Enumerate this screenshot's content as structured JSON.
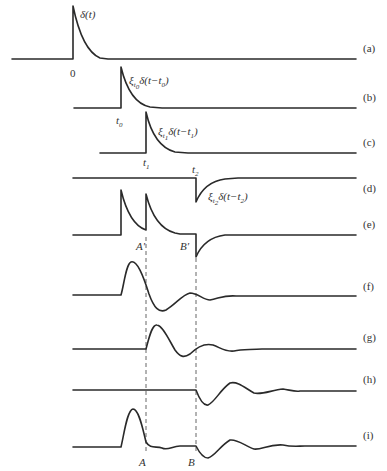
{
  "figure": {
    "type": "signal-superposition-diagram",
    "rows": [
      {
        "id": "a",
        "label": "(a)",
        "annotation": "δ(t)",
        "axis_label": "0"
      },
      {
        "id": "b",
        "label": "(b)",
        "annotation": "ξt0δ(t−t0)",
        "axis_label": "t0"
      },
      {
        "id": "c",
        "label": "(c)",
        "annotation": "ξt1δ(t−t1)",
        "axis_label": "t1"
      },
      {
        "id": "d",
        "label": "(d)",
        "annotation": "ξt2δ(t−t2)",
        "axis_label": "t2"
      },
      {
        "id": "e",
        "label": "(e)",
        "markers": [
          "A′",
          "B′"
        ]
      },
      {
        "id": "f",
        "label": "(f)"
      },
      {
        "id": "g",
        "label": "(g)"
      },
      {
        "id": "h",
        "label": "(h)"
      },
      {
        "id": "i",
        "label": "(i)",
        "markers": [
          "A",
          "B"
        ]
      }
    ],
    "labels": {
      "a": "(a)",
      "b": "(b)",
      "c": "(c)",
      "d": "(d)",
      "e": "(e)",
      "f": "(f)",
      "g": "(g)",
      "h": "(h)",
      "i": "(i)"
    },
    "annotations": {
      "delta_t": "δ(t)",
      "zero": "0",
      "xi": "ξ",
      "delta_shift": "δ(t−",
      "close": ")",
      "t": "t",
      "sub0": "0",
      "sub1": "1",
      "sub2": "2",
      "A_prime": "A′",
      "B_prime": "B′",
      "A": "A",
      "B": "B"
    },
    "colors": {
      "stroke": "#2a2a2a",
      "text": "#333333",
      "background": "#ffffff"
    }
  }
}
